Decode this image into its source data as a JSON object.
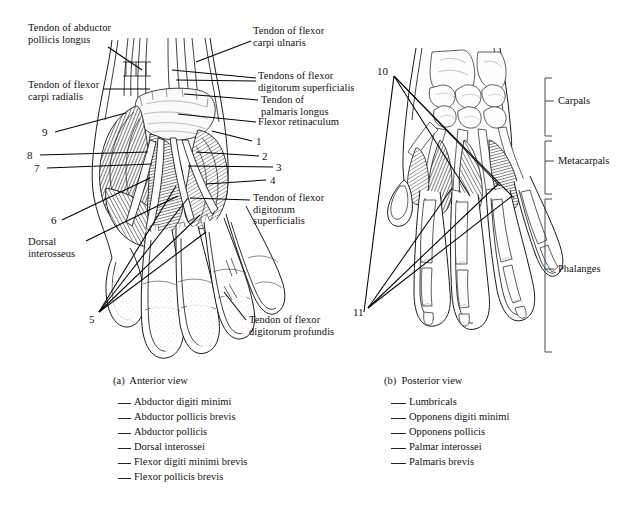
{
  "figure": {
    "title_a": "(a)  Anterior view",
    "title_b": "(b)  Posterior view"
  },
  "anterior": {
    "labels": [
      {
        "id": "tendon-abductor-pollicis-longus",
        "text": "Tendon of abductor\npollicis longus",
        "x": 28,
        "y": 22
      },
      {
        "id": "tendon-flexor-carpi-radialis",
        "text": "Tendon of flexor\ncarpi radialis",
        "x": 28,
        "y": 79
      },
      {
        "id": "tendon-flexor-carpi-ulnaris",
        "text": "Tendon of flexor\ncarpi ulnaris",
        "x": 253,
        "y": 25
      },
      {
        "id": "tendons-flexor-digitorum-superficialis",
        "text": "Tendons of flexor\ndigitorum superficialis",
        "x": 258,
        "y": 72
      },
      {
        "id": "tendon-palmaris-longus",
        "text": "Tendon of\npalmaris longus",
        "x": 261,
        "y": 94
      },
      {
        "id": "flexor-retinaculum",
        "text": "Flexor retinaculum",
        "x": 258,
        "y": 119
      },
      {
        "id": "tendon-flexor-digitorum-superficialis-2",
        "text": "Tendon of flexor\ndigitorum\nsuperficialis",
        "x": 253,
        "y": 192
      },
      {
        "id": "dorsal-interosseus",
        "text": "Dorsal\ninterosseus",
        "x": 28,
        "y": 238
      },
      {
        "id": "tendon-flexor-digitorum-profundis",
        "text": "Tendon of flexor\ndigitorum profundis",
        "x": 249,
        "y": 316
      }
    ],
    "numbers": [
      {
        "id": "callout-9",
        "text": "9",
        "x": 42,
        "y": 127
      },
      {
        "id": "callout-8",
        "text": "8",
        "x": 27,
        "y": 150
      },
      {
        "id": "callout-7",
        "text": "7",
        "x": 34,
        "y": 163
      },
      {
        "id": "callout-6",
        "text": "6",
        "x": 51,
        "y": 217
      },
      {
        "id": "callout-5",
        "text": "5",
        "x": 91,
        "y": 316
      },
      {
        "id": "callout-1",
        "text": "1",
        "x": 256,
        "y": 137
      },
      {
        "id": "callout-2",
        "text": "2",
        "x": 262,
        "y": 152
      },
      {
        "id": "callout-3",
        "text": "3",
        "x": 276,
        "y": 163
      },
      {
        "id": "callout-4",
        "text": "4",
        "x": 270,
        "y": 176
      }
    ]
  },
  "posterior": {
    "numbers": [
      {
        "id": "callout-10",
        "text": "10",
        "x": 378,
        "y": 68
      },
      {
        "id": "callout-11",
        "text": "11",
        "x": 353,
        "y": 309
      }
    ],
    "brackets": [
      {
        "id": "bracket-carpals",
        "label": "Carpals",
        "top": 78,
        "bottom": 136,
        "label_y": 101
      },
      {
        "id": "bracket-metacarpals",
        "label": "Metacarpals",
        "top": 141,
        "bottom": 194,
        "label_y": 161
      },
      {
        "id": "bracket-phalanges",
        "label": "Phalanges",
        "top": 199,
        "bottom": 352,
        "label_y": 269
      }
    ]
  },
  "legend": {
    "left": {
      "heading": "(a)  Anterior view",
      "items": [
        "Abductor digiti minimi",
        "Abductor pollicis brevis",
        "Abductor pollicis",
        "Dorsal interossei",
        "Flexor digiti minimi brevis",
        "Flexor pollicis brevis"
      ]
    },
    "right": {
      "heading": "(b)  Posterior view",
      "items": [
        "Lumbricals",
        "Opponens digiti minimi",
        "Opponens pollicis",
        "Palmar interossei",
        "Palmaris brevis"
      ]
    }
  },
  "colors": {
    "background": "#ffffff",
    "ink": "#111111",
    "line": "#000000",
    "muscle_dark": "#3a3a3a",
    "muscle_mid": "#6e6e6e",
    "bone_fill": "#fdfdfd"
  }
}
